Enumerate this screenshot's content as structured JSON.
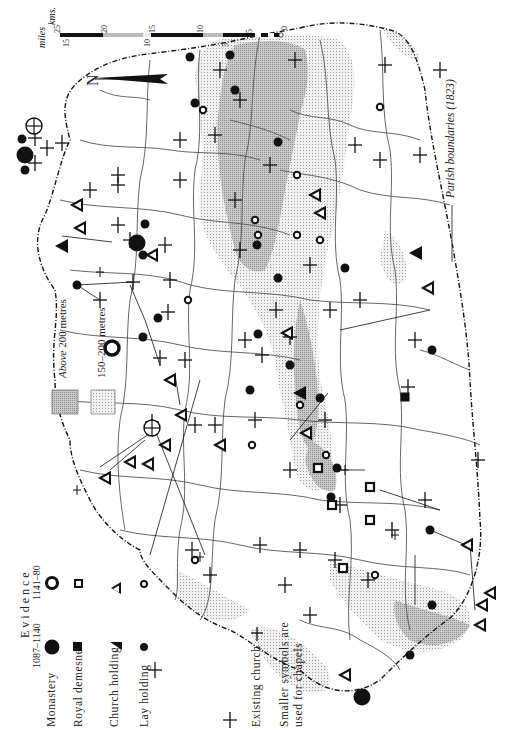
{
  "map": {
    "orientation": "rotated 90 degrees counter-clockwise (north points right)",
    "north_label": "N",
    "colors": {
      "background": "#ffffff",
      "ink": "#111111",
      "relief_above_200": "#b9b9b9",
      "relief_150_200": "#dcdcdc",
      "parish_line": "#555555"
    }
  },
  "scale": {
    "kms_label": "kms.",
    "miles_label": "miles",
    "km_ticks": [
      "25",
      "20",
      "15",
      "10",
      "5",
      "0"
    ],
    "mile_ticks": [
      "15",
      "10",
      "5"
    ]
  },
  "relief_legend": {
    "above_200": {
      "italic": "Above",
      "plain": "200 metres"
    },
    "range_150_200": {
      "plain": "150–200 metres"
    }
  },
  "parish_legend": {
    "label": "Parish boundaries (1823)"
  },
  "evidence_legend": {
    "title": "Evidence",
    "columns": [
      "1087–1140",
      "1141–80"
    ],
    "rows": [
      {
        "label": "Monastery",
        "icon_early": "filled-large-circle",
        "icon_late": "ring-large-circle"
      },
      {
        "label": "Royal demesne",
        "icon_early": "filled-square",
        "icon_late": "open-square"
      },
      {
        "label": "Church holding",
        "icon_early": "filled-triangle",
        "icon_late": "open-triangle"
      },
      {
        "label": "Lay holding",
        "icon_early": "filled-small-circle",
        "icon_late": "open-small-circle"
      }
    ]
  },
  "church_legend": {
    "label": "Existing church",
    "icon": "cross",
    "note_line1": "Smaller symbols are",
    "note_line2": "used for chapels"
  }
}
